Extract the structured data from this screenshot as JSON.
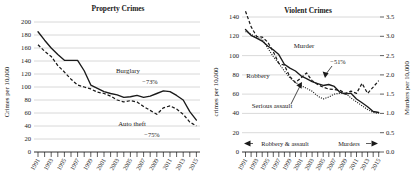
{
  "chart_data": [
    {
      "type": "line",
      "title": "Property Crimes",
      "xlabel": "",
      "ylabel": "Crimes per 10,000",
      "ylim": [
        0,
        200
      ],
      "yticks": [
        0,
        20,
        40,
        60,
        80,
        100,
        120,
        140,
        160,
        180,
        200
      ],
      "grid": true,
      "legend_position": "inline-annotations",
      "x": [
        1991,
        1992,
        1993,
        1994,
        1995,
        1996,
        1997,
        1998,
        1999,
        2000,
        2001,
        2002,
        2003,
        2004,
        2005,
        2006,
        2007,
        2008,
        2009,
        2010,
        2011,
        2012,
        2013,
        2014,
        2015
      ],
      "xticklabels": [
        "1991",
        "1993",
        "1995",
        "1997",
        "1999",
        "2001",
        "2003",
        "2005",
        "2007",
        "2009",
        "2011",
        "2013",
        "2015"
      ],
      "series": [
        {
          "name": "Burglary",
          "style": "solid",
          "values": [
            185,
            172,
            160,
            150,
            141,
            141,
            141,
            125,
            103,
            98,
            93,
            90,
            88,
            84,
            85,
            87,
            84,
            86,
            90,
            94,
            93,
            87,
            80,
            62,
            49
          ]
        },
        {
          "name": "Auto theft",
          "style": "dashed",
          "values": [
            165,
            155,
            147,
            133,
            123,
            112,
            103,
            100,
            97,
            92,
            90,
            86,
            80,
            77,
            79,
            77,
            70,
            64,
            58,
            68,
            71,
            66,
            58,
            46,
            40
          ]
        }
      ],
      "annotations": [
        {
          "text": "Burglary",
          "x": 2005,
          "y": 122
        },
        {
          "text": "−73%",
          "x": 2008,
          "y": 108
        },
        {
          "text": "Auto theft",
          "x": 2006,
          "y": 46
        },
        {
          "text": "−75%",
          "x": 2009,
          "y": 32
        }
      ]
    },
    {
      "type": "line",
      "title": "Violent Crimes",
      "xlabel": "",
      "ylabel": "crimes per 10,000",
      "ylabel_right": "Murders per 10,000",
      "ylim": [
        0,
        140
      ],
      "yticks": [
        0,
        20,
        40,
        60,
        80,
        100,
        120,
        140
      ],
      "ylim_right": [
        0.0,
        3.5
      ],
      "yticks_right": [
        "0.0",
        "0.5",
        "1.0",
        "1.5",
        "2.0",
        "2.5",
        "3.0",
        "3.5"
      ],
      "grid": true,
      "legend_position": "inline-annotations",
      "x": [
        1991,
        1992,
        1993,
        1994,
        1995,
        1996,
        1997,
        1998,
        1999,
        2000,
        2001,
        2002,
        2003,
        2004,
        2005,
        2006,
        2007,
        2008,
        2009,
        2010,
        2011,
        2012,
        2013,
        2014,
        2015
      ],
      "xticklabels": [
        "1991",
        "1993",
        "1995",
        "1997",
        "1999",
        "2001",
        "2003",
        "2005",
        "2007",
        "2009",
        "2011",
        "2013",
        "2015"
      ],
      "series": [
        {
          "name": "Robbery",
          "style": "solid",
          "axis": "left",
          "values": [
            127,
            121,
            118,
            115,
            110,
            106,
            101,
            91,
            87,
            84,
            79,
            76,
            73,
            71,
            69,
            70,
            68,
            62,
            60,
            61,
            55,
            51,
            47,
            42,
            41
          ]
        },
        {
          "name": "Serious assault",
          "style": "dotted",
          "axis": "left",
          "values": [
            125,
            122,
            119,
            117,
            108,
            99,
            92,
            84,
            77,
            72,
            69,
            66,
            63,
            58,
            55,
            57,
            60,
            61,
            61,
            56,
            52,
            48,
            44,
            41,
            40
          ]
        },
        {
          "name": "Murder",
          "style": "dashed",
          "axis": "right",
          "values": [
            3.65,
            3.25,
            3.0,
            2.98,
            2.85,
            2.6,
            2.3,
            2.25,
            1.95,
            1.8,
            1.92,
            2.05,
            1.85,
            1.75,
            1.68,
            1.63,
            1.62,
            1.6,
            1.52,
            1.58,
            1.52,
            1.78,
            1.52,
            1.68,
            1.85
          ]
        }
      ],
      "annotations": [
        {
          "text": "Murder",
          "x": 2001,
          "y": 103
        },
        {
          "text": "−51%",
          "x": 2006,
          "y": 87
        },
        {
          "text": "Robbery",
          "x": 1994,
          "y": 76
        },
        {
          "text": "Serious assault",
          "x": 1998,
          "y": 54
        }
      ],
      "axis_span_labels": {
        "left_span": "Robbery & assault",
        "right_span": "Murders",
        "left_arrow": "◀",
        "right_arrow": "▶"
      }
    }
  ]
}
